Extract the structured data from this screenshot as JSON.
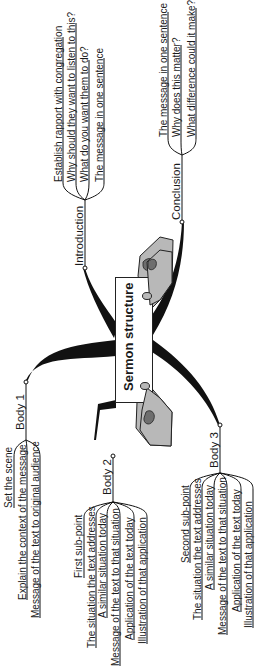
{
  "center": {
    "title": "Sermon structure"
  },
  "branches": {
    "introduction": {
      "label": "Introduction",
      "items": [
        "Establish rapport with congregation",
        "Why should they want to listen to this?",
        "What do you want them to do?",
        "The message in one sentence"
      ]
    },
    "conclusion": {
      "label": "Conclusion",
      "items": [
        "The message in one sentence",
        "Why does this matter?",
        "What difference could it make?"
      ]
    },
    "body1": {
      "label": "Body 1",
      "items": [
        "Set the scene",
        "Explain the context of the message",
        "Message of the text to original audience"
      ]
    },
    "body2": {
      "label": "Body 2",
      "items": [
        "First sub-point",
        "The situation the text addresses",
        "A similar situation today",
        "Message of the text to that situation",
        "Application of the text today",
        "Illustration of that application"
      ]
    },
    "body3": {
      "label": "Body 3",
      "items": [
        "Second sub-point",
        "The situation the text addresses",
        "A similar situation today",
        "Message of the text to that situation",
        "Application of the text today",
        "Illustration of that application"
      ]
    }
  },
  "colors": {
    "line": "#111111",
    "hand_fill": "#b8b8b8",
    "hand_dark": "#6e6e6e"
  }
}
